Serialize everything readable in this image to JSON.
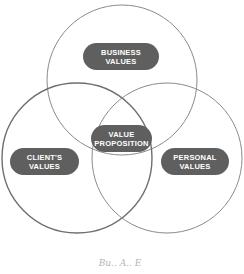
{
  "diagram": {
    "type": "venn",
    "circles": [
      {
        "id": "business",
        "label_line1": "BUSINESS",
        "label_line2": "VALUES",
        "cx": 122,
        "cy": 80,
        "r": 75,
        "stroke": "#8a8a8a"
      },
      {
        "id": "client",
        "label_line1": "CLIENT'S",
        "label_line2": "VALUES",
        "cx": 77,
        "cy": 158,
        "r": 75,
        "stroke": "#6f6f6f"
      },
      {
        "id": "personal",
        "label_line1": "PERSONAL",
        "label_line2": "VALUES",
        "cx": 167,
        "cy": 158,
        "r": 75,
        "stroke": "#8a8a8a"
      }
    ],
    "center": {
      "label_line1": "VALUE",
      "label_line2": "PROPOSITION"
    },
    "pill_color": "#5f5f5f",
    "caption": "Bu.. A.. E"
  }
}
